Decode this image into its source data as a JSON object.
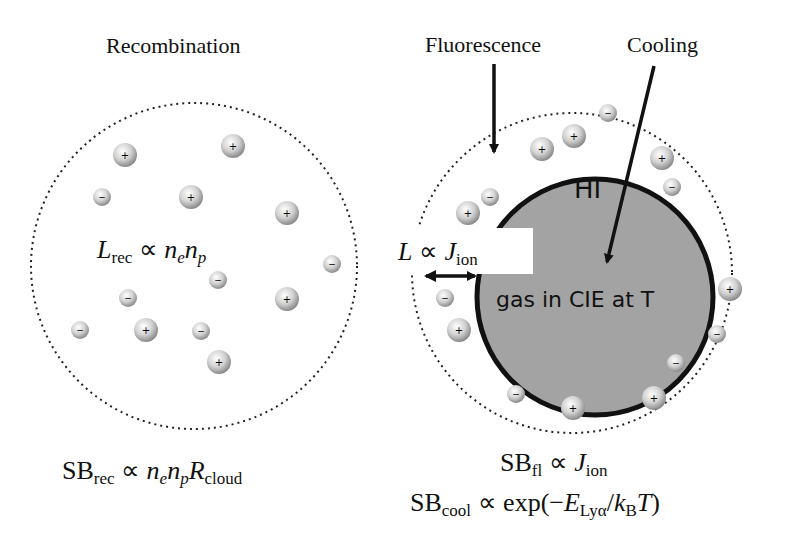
{
  "left_panel": {
    "title": "Recombination",
    "inner_equation": {
      "base": "L",
      "sub": "rec",
      "rel": "∝",
      "rhs": "n",
      "rhs_sub1": "e",
      "rhs2": "n",
      "rhs_sub2": "p"
    },
    "bottom_equation": {
      "base": "SB",
      "sub": "rec",
      "rel": "∝",
      "t1": "n",
      "s1": "e",
      "t2": "n",
      "s2": "p",
      "t3": "R",
      "s3": "cloud"
    }
  },
  "right_panel": {
    "label_fluorescence": "Fluorescence",
    "label_cooling": "Cooling",
    "core_label_top": "HI",
    "core_label_bottom": "gas in CIE at T",
    "shell_equation": {
      "base": "L",
      "rel": "∝",
      "rhs": "J",
      "rhs_sub": "ion"
    },
    "bottom_equation_1": {
      "base": "SB",
      "sub": "fl",
      "rel": "∝",
      "rhs": "J",
      "rhs_sub": "ion"
    },
    "bottom_equation_2": {
      "base": "SB",
      "sub": "cool",
      "rel": "∝",
      "fn": "exp(−",
      "E": "E",
      "E_sub": "Lyα",
      "slash": "/",
      "k": "k",
      "k_sub": "B",
      "T": "T",
      "close": ")"
    }
  },
  "particles": {
    "plus_symbol": "+",
    "minus_symbol": "−"
  },
  "colors": {
    "core_fill": "#a3a3a3",
    "core_stroke": "#111111",
    "dotted_boundary": "#222222",
    "particle_fill": "#c8c8c8"
  }
}
